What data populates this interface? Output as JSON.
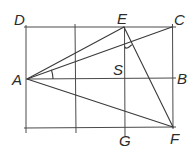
{
  "diagram": {
    "type": "geometry-figure",
    "points": {
      "A": {
        "label": "A",
        "x": 27,
        "y": 79
      },
      "B": {
        "label": "B",
        "x": 173,
        "y": 78
      },
      "C": {
        "label": "C",
        "x": 172,
        "y": 27
      },
      "D": {
        "label": "D",
        "x": 26,
        "y": 27
      },
      "E": {
        "label": "E",
        "x": 124,
        "y": 27
      },
      "F": {
        "label": "F",
        "x": 173,
        "y": 127
      },
      "G": {
        "label": "G",
        "x": 125,
        "y": 128
      },
      "S": {
        "label": "S",
        "x": 125,
        "y": 78
      }
    },
    "labels": {
      "A": "A",
      "B": "B",
      "C": "C",
      "D": "D",
      "E": "E",
      "F": "F",
      "G": "G",
      "S": "S"
    },
    "segments": [
      "AE",
      "AC",
      "AB",
      "AF",
      "EF",
      "DC",
      "EG",
      "CF"
    ],
    "angle_marks": [
      {
        "vertex": "A",
        "between": [
          "AC",
          "AB"
        ]
      },
      {
        "vertex": "intersection of AC and EG",
        "between": [
          "EG",
          "AC"
        ]
      }
    ],
    "colors": {
      "line": "#3a3a3a",
      "text": "#2b2b2b",
      "background": "#ffffff"
    }
  }
}
